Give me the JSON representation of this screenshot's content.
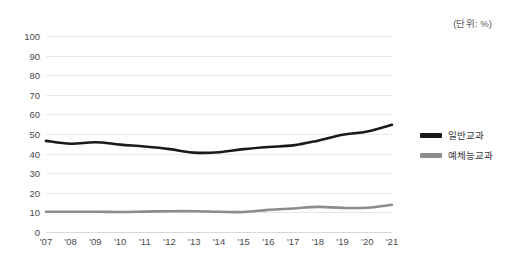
{
  "unit_note": "(단위: %)",
  "legend": {
    "items": [
      {
        "label": "일반교과",
        "color": "#1a1a1a"
      },
      {
        "label": "예체능교과",
        "color": "#8c8c8c"
      }
    ]
  },
  "chart_data": {
    "type": "line",
    "title": "",
    "subtitle": "",
    "xlabel": "",
    "ylabel": "",
    "unit": "%",
    "ylim": [
      0,
      100
    ],
    "ytick_step": 10,
    "yticks": [
      0,
      10,
      20,
      30,
      40,
      50,
      60,
      70,
      80,
      90,
      100
    ],
    "grid": true,
    "legend_position": "right",
    "categories": [
      "'07",
      "'08",
      "'09",
      "'10",
      "'11",
      "'12",
      "'13",
      "'14",
      "'15",
      "'16",
      "'17",
      "'18",
      "'19",
      "'20",
      "'21"
    ],
    "series": [
      {
        "name": "일반교과",
        "color": "#1a1a1a",
        "values": [
          46.5,
          45.0,
          45.8,
          44.6,
          43.6,
          42.3,
          40.5,
          40.7,
          42.3,
          43.4,
          44.2,
          46.6,
          49.6,
          51.3,
          54.7
        ]
      },
      {
        "name": "예체능교과",
        "color": "#8c8c8c",
        "values": [
          10.3,
          10.3,
          10.3,
          10.2,
          10.4,
          10.6,
          10.6,
          10.3,
          10.2,
          11.3,
          12.0,
          12.8,
          12.3,
          12.4,
          13.9
        ]
      }
    ]
  }
}
